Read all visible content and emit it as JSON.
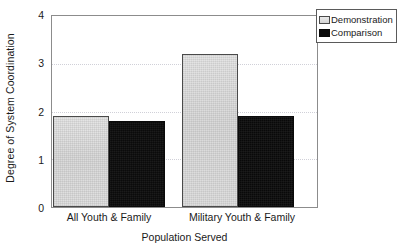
{
  "chart_data": {
    "type": "bar",
    "title": "",
    "xlabel": "Population Served",
    "ylabel": "Degree of System Coordination",
    "categories": [
      "All Youth & Family",
      "Military Youth & Family"
    ],
    "series": [
      {
        "name": "Demonstration",
        "values": [
          1.9,
          3.2
        ],
        "color": "#d9d9d9"
      },
      {
        "name": "Comparison",
        "values": [
          1.8,
          1.9
        ],
        "color": "#0b0b0b"
      }
    ],
    "ylim": [
      0,
      4
    ],
    "ytick_labels": [
      "0",
      "1",
      "2",
      "3",
      "4"
    ],
    "ytick_values": [
      0,
      1,
      2,
      3,
      4
    ],
    "gridlines_at": [
      1,
      2,
      3
    ],
    "grid": true,
    "legend_position": "top-right-outside"
  },
  "axes": {
    "y_title": "Degree of System Coordination",
    "x_title": "Population Served",
    "y_ticks": [
      {
        "label": "4",
        "value": 4
      },
      {
        "label": "3",
        "value": 3
      },
      {
        "label": "2",
        "value": 2
      },
      {
        "label": "1",
        "value": 1
      },
      {
        "label": "0",
        "value": 0
      }
    ],
    "x_categories": [
      {
        "label": "All Youth & Family"
      },
      {
        "label": "Military Youth & Family"
      }
    ]
  },
  "legend": {
    "entries": [
      {
        "label": "Demonstration",
        "swatch": "light-gray-filled-square-icon"
      },
      {
        "label": "Comparison",
        "swatch": "black-filled-square-icon"
      }
    ]
  }
}
